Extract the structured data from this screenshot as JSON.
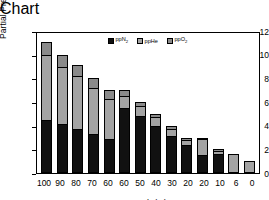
{
  "chart_data": {
    "type": "bar",
    "subtype": "stacked-bar",
    "title": "",
    "xlabel": "Depth (m)",
    "ylabel": "Partial Pressure",
    "categories": [
      "100",
      "90",
      "80",
      "70",
      "60",
      "60",
      "50",
      "40",
      "30",
      "20",
      "20",
      "10",
      "6",
      "0"
    ],
    "ylim": [
      0,
      12
    ],
    "yticks": [
      0,
      2,
      4,
      6,
      8,
      10,
      12
    ],
    "grid": false,
    "legend_position": "top-center",
    "series": [
      {
        "name": "ppN2",
        "label": "ppN",
        "sub": "2",
        "color": "#111111",
        "values": [
          4.5,
          4.1,
          3.7,
          3.3,
          2.85,
          5.5,
          4.8,
          4.0,
          3.15,
          2.35,
          1.5,
          1.6,
          0,
          0
        ]
      },
      {
        "name": "ppHe",
        "label": "ppHe",
        "sub": "",
        "color": "#a3a3a3",
        "values": [
          5.5,
          4.9,
          4.5,
          3.85,
          3.4,
          1.0,
          0.85,
          0.7,
          0.55,
          0.45,
          1.35,
          0.25,
          1.6,
          1.0
        ]
      },
      {
        "name": "ppO2",
        "label": "ppO",
        "sub": "2",
        "color": "#8a8a8a",
        "values": [
          1.1,
          1.0,
          0.9,
          0.85,
          0.75,
          0.5,
          0.35,
          0.3,
          0.3,
          0.2,
          0.15,
          0.15,
          0.0,
          0.0
        ]
      }
    ],
    "totals": [
      11.1,
      10.0,
      9.1,
      8.0,
      7.0,
      7.0,
      6.0,
      5.0,
      4.0,
      3.0,
      3.0,
      2.0,
      1.6,
      1.0
    ]
  },
  "axes": {
    "y_title": "Partial Pressure",
    "x_title": "Depth (m)",
    "y_tick_labels": [
      "12",
      "10",
      "8",
      "6",
      "4",
      "2",
      "0"
    ]
  }
}
